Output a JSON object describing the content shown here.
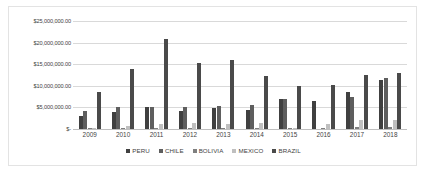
{
  "chart_data": {
    "type": "bar",
    "title": "",
    "xlabel": "",
    "ylabel": "",
    "ylim": [
      0,
      25000000
    ],
    "grid": true,
    "legend_position": "bottom",
    "categories": [
      "2009",
      "2010",
      "2011",
      "2012",
      "2013",
      "2014",
      "2015",
      "2016",
      "2017",
      "2018"
    ],
    "ytick_labels": [
      "$25,000,000.00",
      "$20,000,000.00",
      "$15,000,000.00",
      "$10,000,000.00",
      "$5,000,000.00",
      "$-"
    ],
    "ytick_values": [
      25000000,
      20000000,
      15000000,
      10000000,
      5000000,
      0
    ],
    "series": [
      {
        "name": "PERU",
        "color": "#404040",
        "values": [
          3100000,
          4000000,
          5000000,
          4200000,
          4900000,
          4400000,
          7000000,
          6600000,
          8600000,
          11400000
        ]
      },
      {
        "name": "CHILE",
        "color": "#5e5e5e",
        "values": [
          4100000,
          5100000,
          5200000,
          5000000,
          5300000,
          5500000,
          7000000,
          0,
          7400000,
          11800000
        ]
      },
      {
        "name": "BOLIVIA",
        "color": "#7f7f7f",
        "values": [
          300000,
          200000,
          200000,
          300000,
          200000,
          200000,
          300000,
          300000,
          400000,
          400000
        ]
      },
      {
        "name": "MEXICO",
        "color": "#bfbfbf",
        "values": [
          150000,
          700000,
          1200000,
          1400000,
          1100000,
          1500000,
          200000,
          1200000,
          2000000,
          2100000
        ]
      },
      {
        "name": "BRAZIL",
        "color": "#4a4a4a",
        "values": [
          8500000,
          13800000,
          20900000,
          15300000,
          16000000,
          12200000,
          10000000,
          10200000,
          12400000,
          12900000
        ]
      }
    ]
  }
}
